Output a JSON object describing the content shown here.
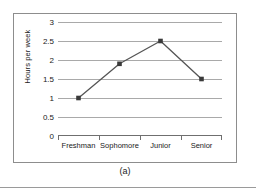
{
  "figure": {
    "caption": "(a)"
  },
  "chart_data": {
    "type": "line",
    "title": "",
    "subtitle": "",
    "xlabel": "",
    "ylabel": "Hours per week",
    "categories": [
      "Freshman",
      "Sophomore",
      "Junior",
      "Senior"
    ],
    "values": [
      1,
      1.9,
      2.5,
      1.5
    ],
    "series": [
      {
        "name": "Hours per week",
        "values": [
          1,
          1.9,
          2.5,
          1.5
        ]
      }
    ],
    "ylim": [
      0,
      3
    ],
    "ytick_labels": [
      "0",
      "0.5",
      "1",
      "1.5",
      "2",
      "2.5",
      "3"
    ],
    "ytick_values": [
      0,
      0.5,
      1,
      1.5,
      2,
      2.5,
      3
    ],
    "grid": "horizontal",
    "legend": "none",
    "marker": "square",
    "colors": {
      "line": "#555555",
      "marker": "#3a3a3a",
      "gridline": "#a9a9a9",
      "axis": "#6f6f6f",
      "frame": "#8d8d8d",
      "text": "#1a1a1a",
      "background": "#ffffff"
    }
  }
}
